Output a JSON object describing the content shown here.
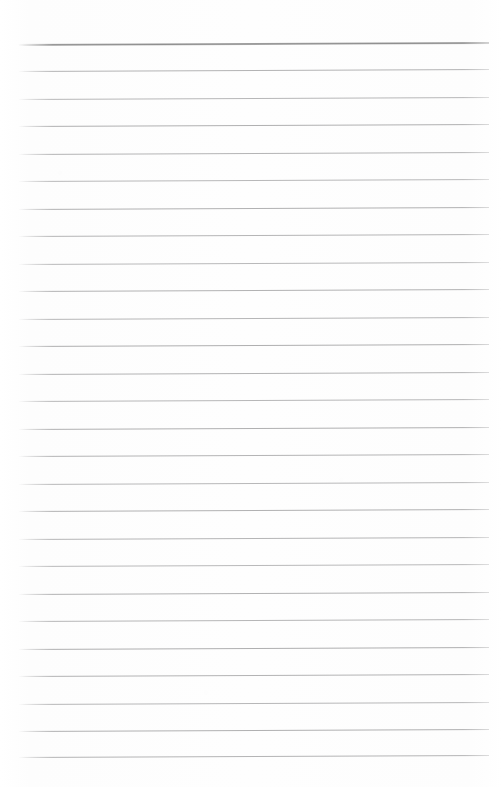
{
  "page": {
    "kind": "scanned-lined-notebook-page",
    "width": 502,
    "height": 787,
    "background_color": "#fefefe",
    "written_text": "",
    "is_blank": true
  },
  "ruling": {
    "line_color": "#b4b4b4",
    "header_line_color": "#8f8f8f",
    "line_count": 27,
    "line_spacing_px": 27.4,
    "first_line_y": 44,
    "left_margin_x": 19,
    "right_margin_x": 489,
    "skew_px": -2,
    "header_line_index": 0,
    "lines": [
      {
        "index": 0,
        "y": 44,
        "weight": "heavy"
      },
      {
        "index": 1,
        "y": 71,
        "weight": "normal"
      },
      {
        "index": 2,
        "y": 99,
        "weight": "normal"
      },
      {
        "index": 3,
        "y": 126,
        "weight": "normal"
      },
      {
        "index": 4,
        "y": 154,
        "weight": "normal"
      },
      {
        "index": 5,
        "y": 181,
        "weight": "normal"
      },
      {
        "index": 6,
        "y": 209,
        "weight": "normal"
      },
      {
        "index": 7,
        "y": 236,
        "weight": "normal"
      },
      {
        "index": 8,
        "y": 264,
        "weight": "normal"
      },
      {
        "index": 9,
        "y": 291,
        "weight": "normal"
      },
      {
        "index": 10,
        "y": 319,
        "weight": "normal"
      },
      {
        "index": 11,
        "y": 346,
        "weight": "normal"
      },
      {
        "index": 12,
        "y": 374,
        "weight": "normal"
      },
      {
        "index": 13,
        "y": 401,
        "weight": "normal"
      },
      {
        "index": 14,
        "y": 429,
        "weight": "normal"
      },
      {
        "index": 15,
        "y": 456,
        "weight": "normal"
      },
      {
        "index": 16,
        "y": 484,
        "weight": "normal"
      },
      {
        "index": 17,
        "y": 511,
        "weight": "normal"
      },
      {
        "index": 18,
        "y": 539,
        "weight": "normal"
      },
      {
        "index": 19,
        "y": 566,
        "weight": "normal"
      },
      {
        "index": 20,
        "y": 594,
        "weight": "normal"
      },
      {
        "index": 21,
        "y": 621,
        "weight": "normal"
      },
      {
        "index": 22,
        "y": 649,
        "weight": "normal"
      },
      {
        "index": 23,
        "y": 676,
        "weight": "normal"
      },
      {
        "index": 24,
        "y": 704,
        "weight": "normal"
      },
      {
        "index": 25,
        "y": 731,
        "weight": "normal"
      },
      {
        "index": 26,
        "y": 757,
        "weight": "normal"
      }
    ]
  }
}
